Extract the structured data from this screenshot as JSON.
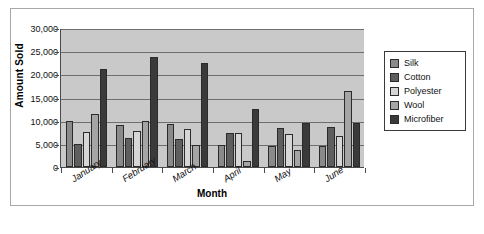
{
  "chart_data": {
    "type": "bar",
    "title": "",
    "xlabel": "Month",
    "ylabel": "Amount Sold",
    "categories": [
      "January",
      "February",
      "March",
      "April",
      "May",
      "June"
    ],
    "ylim": [
      0,
      30000
    ],
    "yticks": [
      0,
      5000,
      10000,
      15000,
      20000,
      25000,
      30000
    ],
    "ytick_labels": [
      "0",
      "5,000",
      "10,000",
      "15,000",
      "20,000",
      "25,000",
      "30,000"
    ],
    "grid": true,
    "legend_position": "right-outside",
    "series": [
      {
        "name": "Silk",
        "color": "#8a8a8a",
        "values": [
          10000,
          9000,
          9200,
          4700,
          4600,
          4500
        ]
      },
      {
        "name": "Cotton",
        "color": "#5e5e5e",
        "values": [
          5000,
          6300,
          6000,
          7400,
          8500,
          8600
        ]
      },
      {
        "name": "Polyester",
        "color": "#d6d6d6",
        "values": [
          7500,
          7800,
          8300,
          7400,
          7200,
          6800
        ]
      },
      {
        "name": "Wool",
        "color": "#a5a5a5",
        "values": [
          11500,
          10000,
          4700,
          1200,
          3700,
          16500
        ]
      },
      {
        "name": "Microfiber",
        "color": "#3a3a3a",
        "values": [
          21200,
          23700,
          22400,
          12600,
          9600,
          9600
        ]
      }
    ]
  },
  "caption": {
    "text": ""
  }
}
